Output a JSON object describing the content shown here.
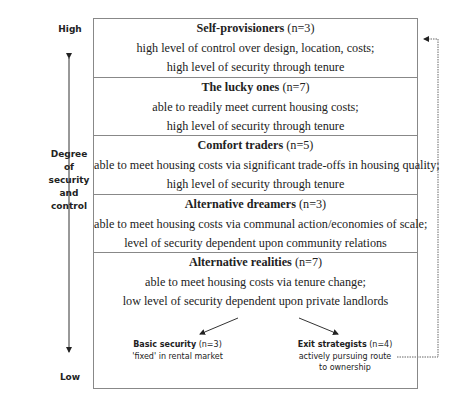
{
  "axis": {
    "high_label": "High",
    "low_label": "Low",
    "title_lines": [
      "Degree",
      "of",
      "security",
      "and",
      "control"
    ]
  },
  "categories": [
    {
      "name": "Self-provisioners",
      "count": "(n=3)",
      "lines": [
        "high level of control over design, location, costs;",
        "high level of security through tenure"
      ]
    },
    {
      "name": "The lucky ones",
      "count": "(n=7)",
      "lines": [
        "able to readily meet current housing costs;",
        "high level of security through tenure"
      ]
    },
    {
      "name": "Comfort traders",
      "count": "(n=5)",
      "lines": [
        "able to meet housing costs via significant trade-offs in housing quality;",
        "high level of security through tenure"
      ]
    },
    {
      "name": "Alternative dreamers",
      "count": "(n=3)",
      "lines": [
        "able to meet housing costs via communal action/economies of scale;",
        "level of security dependent upon community relations"
      ]
    },
    {
      "name": "Alternative realities",
      "count": "(n=7)",
      "lines": [
        "able to meet housing costs via tenure change;",
        "low level of security dependent upon private landlords"
      ]
    }
  ],
  "subgroups": [
    {
      "name": "Basic security",
      "count": "(n=3)",
      "lines": [
        "'fixed' in rental market"
      ]
    },
    {
      "name": "Exit strategists",
      "count": "(n=4)",
      "lines": [
        "actively pursuing route",
        "to ownership"
      ]
    }
  ]
}
